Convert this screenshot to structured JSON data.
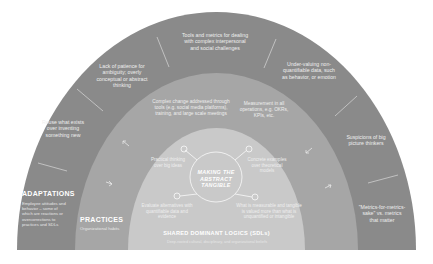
{
  "diagram": {
    "rings": {
      "outer": {
        "label": "ADAPTATIONS",
        "sublabel": "Employee attitudes and behavior – some of which are reactions or overcorrections to practices and SDLs",
        "color": "#8a8a8a"
      },
      "middle": {
        "label": "PRACTICES",
        "sublabel": "Organizational habits",
        "color": "#a6a6a6"
      },
      "core": {
        "label": "SHARED DOMINANT LOGICS (SDLs)",
        "sublabel": "Deep-rooted cultural, disciplinary, and organizational beliefs",
        "color": "#c9c9c9"
      }
    },
    "center": {
      "title_line1": "MAKING THE",
      "title_line2": "ABSTRACT",
      "title_line3": "TANGIBLE"
    },
    "adaptations": [
      "Reuse what exists over inventing something new",
      "Lack of patience for ambiguity; overly conceptual or abstract thinking",
      "Tools and metrics for dealing with complex interpersonal and social challenges",
      "Under-valuing non-quantifiable data, such as behavior, or emotion",
      "Suspicions of big picture thinkers",
      "\"Metrics-for-metrics-sake\" vs. metrics that matter"
    ],
    "practices": [
      "Complex change addressed through tools (e.g. social media platforms), training, and large scale meetings",
      "Measurement in all operations, e.g. OKRs, KPIs, etc."
    ],
    "logics": [
      "Practical thinking over big ideas",
      "Concrete examples over theoretical models",
      "Evaluate alternatives with quantifiable data and evidence",
      "What is measurable and tangible is valued more than what is unquantified or intangible"
    ]
  }
}
